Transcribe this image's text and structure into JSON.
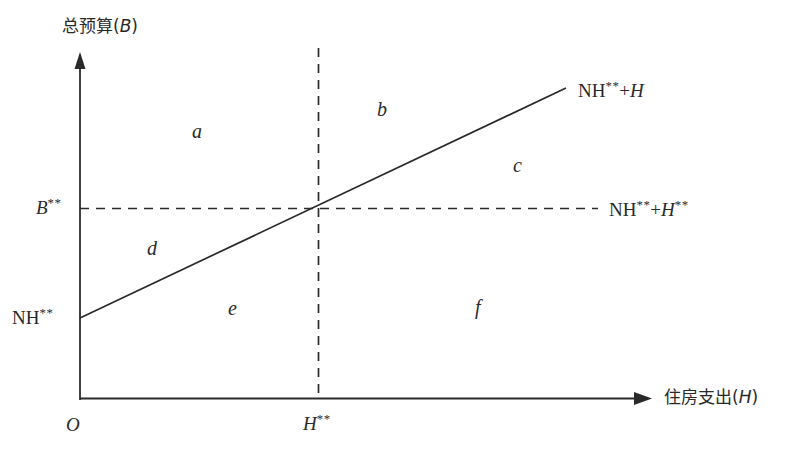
{
  "figure": {
    "type": "economics-budget-diagram",
    "background_color": "#ffffff",
    "line_color": "#2a2a2a"
  },
  "axes": {
    "y_title_cjk": "总预算(",
    "y_title_var": "B",
    "y_title_close": ")",
    "x_title_cjk": "住房支出(",
    "x_title_var": "H",
    "x_title_close": ")",
    "origin_label": "O"
  },
  "ticks": {
    "y_tick_var": "B",
    "y_tick_sup": "**",
    "x_tick_var": "H",
    "x_tick_sup": "**"
  },
  "lines": {
    "budget_line_label_base": "NH",
    "budget_line_label_sup": "**",
    "budget_line_label_plus": "+",
    "budget_line_label_var": "H",
    "dashed_line_label_base": "NH",
    "dashed_line_label_sup": "**",
    "dashed_line_label_plus": "+",
    "dashed_line_label_var": "H",
    "dashed_line_label_var_sup": "**",
    "intercept_label_base": "NH",
    "intercept_label_sup": "**"
  },
  "regions": [
    {
      "id": "a",
      "label": "a"
    },
    {
      "id": "b",
      "label": "b"
    },
    {
      "id": "c",
      "label": "c"
    },
    {
      "id": "d",
      "label": "d"
    },
    {
      "id": "e",
      "label": "e"
    },
    {
      "id": "f",
      "label": "f"
    }
  ]
}
